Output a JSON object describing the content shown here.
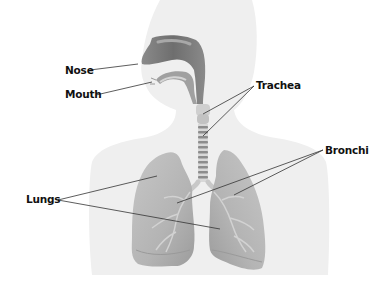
{
  "diagram": {
    "type": "anatomy-labeled",
    "labels": [
      {
        "id": "nose",
        "text": "Nose",
        "x": 65,
        "y": 65,
        "targets": [
          [
            138,
            64
          ]
        ]
      },
      {
        "id": "mouth",
        "text": "Mouth",
        "x": 65,
        "y": 89,
        "targets": [
          [
            152,
            82
          ]
        ]
      },
      {
        "id": "trachea",
        "text": "Trachea",
        "x": 256,
        "y": 80,
        "targets": [
          [
            203,
            114
          ],
          [
            203,
            136
          ]
        ]
      },
      {
        "id": "bronchi",
        "text": "Bronchi",
        "x": 325,
        "y": 145,
        "targets": [
          [
            177,
            203
          ],
          [
            234,
            195
          ]
        ]
      },
      {
        "id": "lungs",
        "text": "Lungs",
        "x": 26,
        "y": 194,
        "targets": [
          [
            157,
            176
          ],
          [
            220,
            229
          ]
        ]
      }
    ],
    "colors": {
      "background": "#ffffff",
      "silhouette": "#efefef",
      "airway": "#7d7d7d",
      "airway_light": "#bdbdbd",
      "lung": "#b9b9b9",
      "lung_dark": "#9a9a9a",
      "leader_line": "#333333",
      "label_text": "#111111"
    }
  }
}
